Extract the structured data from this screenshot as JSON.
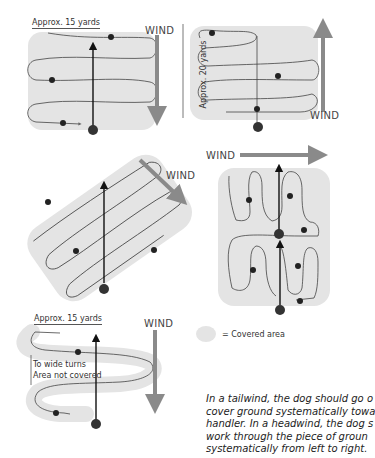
{
  "diagram": {
    "panels": [
      {
        "id": "tailwind-top-left",
        "width_label": "Approx. 15 yards",
        "wind_label": "WIND",
        "wind_direction": "down"
      },
      {
        "id": "headwind-top-right",
        "height_label": "Approx. 20 yards",
        "wind_label": "WIND",
        "wind_direction": "up"
      },
      {
        "id": "diagonal-wind-middle-left",
        "wind_label": "WIND",
        "wind_direction": "down-right"
      },
      {
        "id": "crosswind-middle-right",
        "wind_label": "WIND",
        "wind_direction": "right"
      },
      {
        "id": "wide-turns-bottom-left",
        "width_label": "Approx. 15 yards",
        "wind_label": "WIND",
        "wind_direction": "down",
        "annotation_line1": "To wide turns",
        "annotation_line2": "Area not covered"
      }
    ],
    "legend": {
      "label": "= Covered area",
      "color": "#e4e4e4"
    },
    "caption": {
      "line1": "In a tailwind, the dog should go o",
      "line2": "cover ground systematically towa",
      "line3": "handler. In a headwind, the dog s",
      "line4": "work through the piece of groun",
      "line5": "systematically from left to right."
    },
    "colors": {
      "covered_area": "#e4e4e4",
      "wind_arrow": "#8a8a8a",
      "path": "#444444",
      "handler_arrow": "#111111"
    }
  }
}
